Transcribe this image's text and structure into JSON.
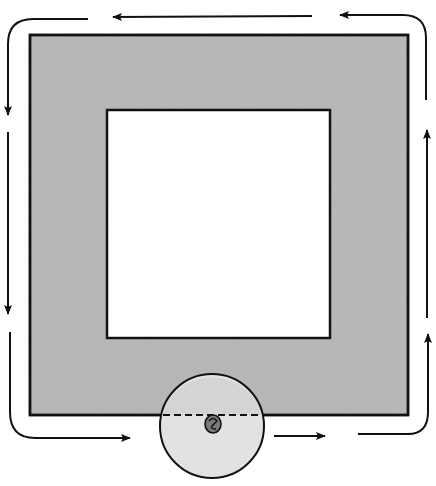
{
  "diagram": {
    "type": "magnetic-circuit-with-gap",
    "colors": {
      "background": "#ffffff",
      "core_fill": "#b8b8b8",
      "window_fill": "#ffffff",
      "stroke": "#111111",
      "circle_fill": "#e2e2e2",
      "symbol_fill": "#7a7a7a"
    },
    "core": {
      "x": 30,
      "y": 35,
      "width": 378,
      "height": 380
    },
    "window": {
      "x": 107,
      "y": 110,
      "width": 223,
      "height": 228
    },
    "detail_circle": {
      "cx": 212,
      "cy": 426,
      "r": 52
    },
    "flux_path": {
      "direction": "counter-clockwise",
      "arrows": [
        {
          "segment": "top-right",
          "direction": "left"
        },
        {
          "segment": "top-middle",
          "direction": "left"
        },
        {
          "segment": "left-upper",
          "direction": "down"
        },
        {
          "segment": "left-lower",
          "direction": "down"
        },
        {
          "segment": "bottom-left",
          "direction": "right"
        },
        {
          "segment": "bottom-right",
          "direction": "right"
        },
        {
          "segment": "right-lower",
          "direction": "up"
        },
        {
          "segment": "right-upper",
          "direction": "up"
        }
      ]
    }
  }
}
